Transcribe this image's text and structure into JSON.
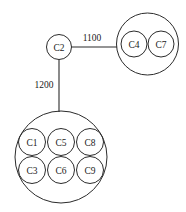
{
  "diagram": {
    "type": "node-cluster-graph",
    "background_color": "#ffffff",
    "stroke_color": "#2b2b2b",
    "text_color": "#1a1a1a",
    "standalone_nodes": [
      {
        "id": "C2",
        "label": "C2",
        "cx": 59,
        "cy": 47,
        "r": 12.5
      }
    ],
    "clusters": [
      {
        "name": "cluster-right",
        "cx": 147.5,
        "cy": 44,
        "r": 31,
        "nodes": [
          {
            "id": "C4",
            "label": "C4",
            "cx": 134,
            "cy": 44,
            "r": 13
          },
          {
            "id": "C7",
            "label": "C7",
            "cx": 161,
            "cy": 44,
            "r": 13
          }
        ]
      },
      {
        "name": "cluster-bottom",
        "cx": 61,
        "cy": 157,
        "r": 46,
        "nodes": [
          {
            "id": "C1",
            "label": "C1",
            "cx": 32,
            "cy": 142,
            "r": 13.5
          },
          {
            "id": "C5",
            "label": "C5",
            "cx": 61,
            "cy": 142,
            "r": 13.5
          },
          {
            "id": "C8",
            "label": "C8",
            "cx": 90,
            "cy": 142,
            "r": 13.5
          },
          {
            "id": "C3",
            "label": "C3",
            "cx": 32,
            "cy": 170,
            "r": 13.5
          },
          {
            "id": "C6",
            "label": "C6",
            "cx": 61,
            "cy": 170,
            "r": 13.5
          },
          {
            "id": "C9",
            "label": "C9",
            "cx": 90,
            "cy": 170,
            "r": 13.5
          }
        ]
      }
    ],
    "edges": [
      {
        "name": "edge-c2-cluster-right",
        "from": "C2",
        "to": "cluster-right",
        "weight": "1100",
        "x1": 71.5,
        "y1": 47,
        "x2": 117,
        "y2": 47,
        "label_x": 92,
        "label_y": 38
      },
      {
        "name": "edge-c2-cluster-bottom",
        "from": "C2",
        "to": "cluster-bottom",
        "weight": "1200",
        "x1": 59,
        "y1": 59.5,
        "x2": 59,
        "y2": 112,
        "label_x": 44,
        "label_y": 85
      }
    ]
  }
}
